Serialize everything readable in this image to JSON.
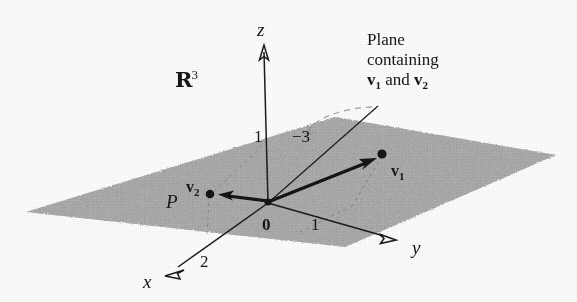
{
  "figure": {
    "space_label": "R",
    "space_exponent": "3",
    "plane_label": "P",
    "origin_label": "0",
    "axes": [
      {
        "name": "z",
        "label": "z"
      },
      {
        "name": "y",
        "label": "y"
      },
      {
        "name": "x",
        "label": "x"
      }
    ],
    "ticks": [
      {
        "axis": "z",
        "label": "1"
      },
      {
        "axis": "z-right",
        "label": "−3"
      },
      {
        "axis": "y",
        "label": "1"
      },
      {
        "axis": "x",
        "label": "2"
      }
    ],
    "vectors": [
      {
        "name": "v1",
        "label": "v",
        "subscript": "1"
      },
      {
        "name": "v2",
        "label": "v",
        "subscript": "2"
      }
    ],
    "annotation": {
      "line1": "Plane",
      "line2": "containing",
      "line3_pre": "v",
      "line3_sub1": "1",
      "line3_mid": " and ",
      "line3_post": "v",
      "line3_sub2": "2"
    },
    "colors": {
      "plane_fill": "#a8a8a8",
      "ink": "#171717",
      "paper": "#fdfdfc",
      "leader": "#9a9a9a"
    }
  }
}
